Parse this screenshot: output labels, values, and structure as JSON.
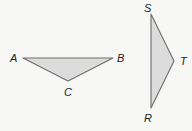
{
  "colors": {
    "background": "#f7f7f5",
    "fill": "#dcdcdc",
    "stroke": "#6e6e6e",
    "label": "#222222"
  },
  "triangles": [
    {
      "name": "ABC",
      "vertices": {
        "A": {
          "label": "A",
          "x": 23,
          "y": 58,
          "label_x": 10,
          "label_y": 62
        },
        "B": {
          "label": "B",
          "x": 113,
          "y": 58,
          "label_x": 117,
          "label_y": 62
        },
        "C": {
          "label": "C",
          "x": 68,
          "y": 81,
          "label_x": 64,
          "label_y": 96
        }
      }
    },
    {
      "name": "RST",
      "vertices": {
        "S": {
          "label": "S",
          "x": 151,
          "y": 14,
          "label_x": 144,
          "label_y": 12
        },
        "T": {
          "label": "T",
          "x": 174,
          "y": 61,
          "label_x": 180,
          "label_y": 65
        },
        "R": {
          "label": "R",
          "x": 151,
          "y": 108,
          "label_x": 144,
          "label_y": 122
        }
      }
    }
  ]
}
